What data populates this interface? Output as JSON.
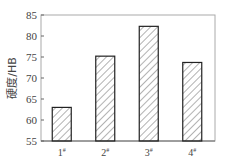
{
  "chart_data": {
    "type": "bar",
    "title": "",
    "xlabel": "",
    "ylabel": "硬度/HB",
    "categories": [
      "1#",
      "2#",
      "3#",
      "4#"
    ],
    "category_labels": [
      {
        "num": "1",
        "sup": "#"
      },
      {
        "num": "2",
        "sup": "#"
      },
      {
        "num": "3",
        "sup": "#"
      },
      {
        "num": "4",
        "sup": "#"
      }
    ],
    "values": [
      63,
      75.2,
      82.3,
      73.7
    ],
    "ylim": [
      55,
      85
    ],
    "yticks": [
      55,
      60,
      65,
      70,
      75,
      80,
      85
    ],
    "grid": false,
    "legend": null,
    "bar_fill": "diagonal-hatch",
    "colors": {
      "bar_edge": "#222222",
      "hatch": "#555555",
      "frame": "#aaaaaa",
      "text": "#444444"
    }
  }
}
